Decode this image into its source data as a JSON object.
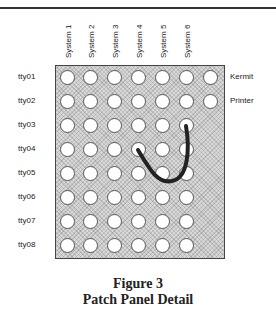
{
  "figure": {
    "columns": [
      "System 1",
      "System 2",
      "System 3",
      "System 4",
      "System 5",
      "System 6"
    ],
    "rows": [
      "tty01",
      "tty02",
      "tty03",
      "tty04",
      "tty05",
      "tty06",
      "tty07",
      "tty08"
    ],
    "right_labels": {
      "tty01": "Kermit",
      "tty02": "Printer"
    },
    "jacks_per_row": [
      7,
      7,
      6,
      6,
      6,
      6,
      6,
      6
    ],
    "patch_cable": {
      "from": {
        "row": "tty03",
        "column": "System 6"
      },
      "to": {
        "row": "tty04",
        "column": "System 4"
      }
    },
    "caption_line1": "Figure 3",
    "caption_line2": "Patch Panel Detail"
  }
}
